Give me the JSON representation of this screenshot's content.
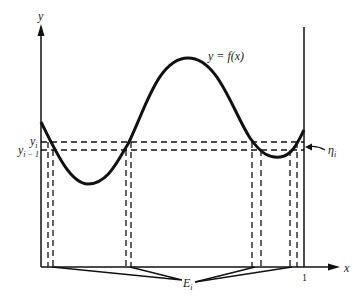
{
  "figure": {
    "y_axis_label": "y",
    "x_axis_label": "x",
    "curve_label": "y = f(x)",
    "y_i_label": "y",
    "y_i_sub": "i",
    "y_im1_label": "y",
    "y_im1_sub": "i − 1",
    "eta_label": "η",
    "eta_sub": "i",
    "E_label": "E",
    "E_sub": "i",
    "x_tick_label": "1"
  }
}
